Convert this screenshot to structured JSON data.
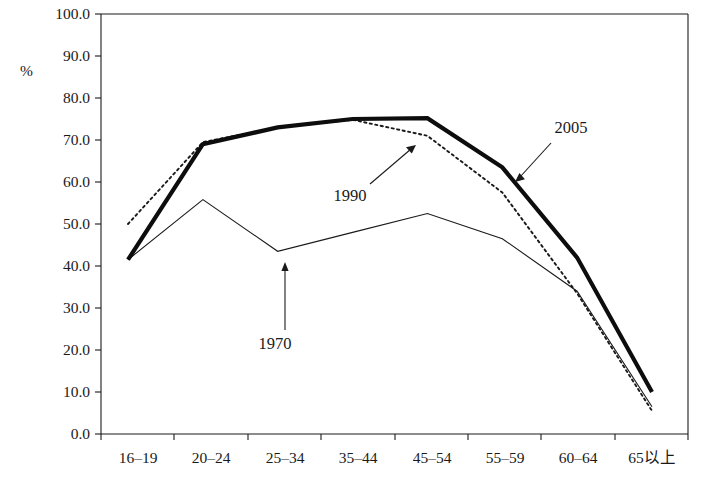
{
  "chart_data": {
    "type": "line",
    "title": "",
    "subtitle": "",
    "xlabel": "",
    "ylabel": "%",
    "ylim": [
      0.0,
      100.0
    ],
    "ytick_step": 10.0,
    "grid": false,
    "legend_position": "inline-annotations",
    "categories": [
      "16–19",
      "20–24",
      "25–34",
      "35–44",
      "45–54",
      "55–59",
      "60–64",
      "65以上"
    ],
    "ytick_labels": [
      "0.0",
      "10.0",
      "20.0",
      "30.0",
      "40.0",
      "50.0",
      "60.0",
      "70.0",
      "80.0",
      "90.0",
      "100.0"
    ],
    "series": [
      {
        "name": "1970",
        "style": "thin-solid",
        "color": "#1a1a1a",
        "values": [
          41.5,
          55.8,
          43.5,
          48.0,
          52.5,
          46.5,
          34.0,
          6.5
        ]
      },
      {
        "name": "1990",
        "style": "dotted",
        "color": "#1a1a1a",
        "values": [
          50.0,
          69.5,
          73.0,
          74.8,
          71.0,
          57.5,
          33.5,
          5.5
        ]
      },
      {
        "name": "2005",
        "style": "thick-solid",
        "color": "#0d0d0d",
        "values": [
          41.5,
          69.0,
          73.0,
          75.0,
          75.2,
          63.5,
          42.0,
          10.0
        ]
      }
    ],
    "annotations": [
      {
        "label": "1970",
        "points_to_series": "1970",
        "points_to_category": "25–34"
      },
      {
        "label": "1990",
        "points_to_series": "1990",
        "points_to_category": "45–54"
      },
      {
        "label": "2005",
        "points_to_series": "2005",
        "points_to_category": "55–59"
      }
    ]
  }
}
